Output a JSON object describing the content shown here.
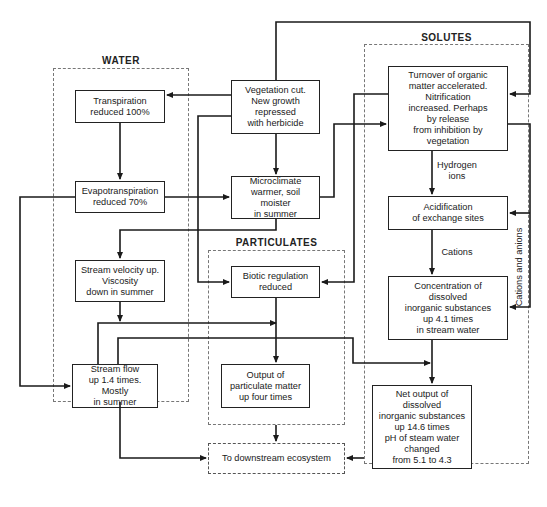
{
  "groups": {
    "water": {
      "title": "WATER"
    },
    "solutes": {
      "title": "SOLUTES"
    },
    "particulates": {
      "title": "PARTICULATES"
    }
  },
  "nodes": {
    "vegetation_cut": "Vegetation cut.\nNew growth\nrepressed\nwith herbicide",
    "transpiration": "Transpiration\nreduced 100%",
    "evapotranspiration": "Evapotranspiration\nreduced 70%",
    "microclimate": "Microclimate\nwarmer, soil moister\nin summer",
    "stream_velocity": "Stream velocity up.\nViscosity\ndown in summer",
    "stream_flow": "Stream flow\nup 1.4 times. Mostly\nin summer",
    "biotic_regulation": "Biotic regulation\nreduced",
    "particulate_output": "Output of\nparticulate matter\nup four times",
    "organic_turnover": "Turnover of organic\nmatter accelerated.\nNitrification\nincreased. Perhaps\nby release\nfrom inhibition by\nvegetation",
    "acidification": "Acidification\nof exchange sites",
    "concentration": "Concentration of\ndissolved\ninorganic substances\nup 4.1 times\nin stream water",
    "net_output": "Net output of\ndissolved\ninorganic substances\nup 14.6 times\npH of steam water\nchanged\nfrom 5.1 to 4.3",
    "downstream": "To downstream ecosystem"
  },
  "edge_labels": {
    "hydrogen_ions": "Hydrogen\nions",
    "cations": "Cations",
    "cations_and_anions": "Cations and anions"
  },
  "colors": {
    "line": "#1a1a1a",
    "dashed_border": "#777777"
  }
}
